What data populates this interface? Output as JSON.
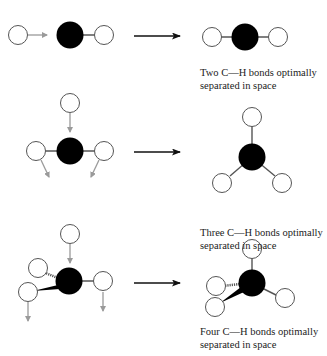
{
  "colors": {
    "carbon": "#000000",
    "hydrogen_fill": "#ffffff",
    "hydrogen_stroke": "#555555",
    "movement_arrow": "#9a9a9a",
    "reaction_arrow": "#111111",
    "bond": "#555555"
  },
  "rows": [
    {
      "id": "two-bonds",
      "caption_line1": "Two C—H bonds optimally",
      "caption_line2": "separated in space"
    },
    {
      "id": "three-bonds",
      "caption_line1": "Three C—H bonds optimally",
      "caption_line2": "separated in space"
    },
    {
      "id": "four-bonds",
      "caption_line1": "Four C—H bonds optimally",
      "caption_line2": "separated in space"
    }
  ]
}
